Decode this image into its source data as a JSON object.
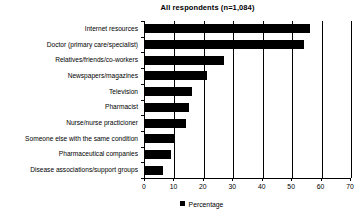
{
  "chart_data": {
    "type": "bar",
    "orientation": "horizontal",
    "title": "All respondents (n=1,084)",
    "xlabel": "",
    "ylabel": "",
    "xlim": [
      0,
      70
    ],
    "xticks": [
      0,
      10,
      20,
      30,
      40,
      50,
      60,
      70
    ],
    "grid": "vertical",
    "legend": {
      "position": "bottom-center",
      "entries": [
        {
          "label": "Percentage",
          "color": "#000000",
          "marker": "square"
        }
      ]
    },
    "categories": [
      "Internet resources",
      "Doctor (primary care/specialist)",
      "Relatives/friends/co-workers",
      "Newspapers/magazines",
      "Television",
      "Pharmacist",
      "Nurse/nurse practicioner",
      "Someone else with the same condition",
      "Pharmaceutical companies",
      "Disease associations/support groups"
    ],
    "series": [
      {
        "name": "Percentage",
        "values": [
          56,
          54,
          27,
          21,
          16,
          15,
          14,
          10,
          9,
          6
        ]
      }
    ]
  }
}
